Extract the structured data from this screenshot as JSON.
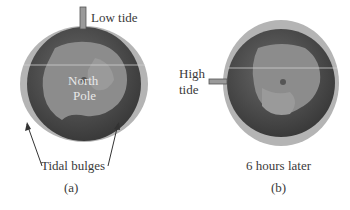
{
  "panel_a": {
    "marker_label": "Low tide",
    "globe_label_line1": "North",
    "globe_label_line2": "Pole",
    "bulge_label": "Tidal bulges",
    "caption": "(a)"
  },
  "panel_b": {
    "marker_label_line1": "High",
    "marker_label_line2": "tide",
    "time_label": "6 hours later",
    "caption": "(b)"
  },
  "colors": {
    "ocean": "#4a4a4a",
    "land": "#8c8c8c",
    "bulge": "#b4b4b4",
    "marker": "#9a9a9a"
  }
}
